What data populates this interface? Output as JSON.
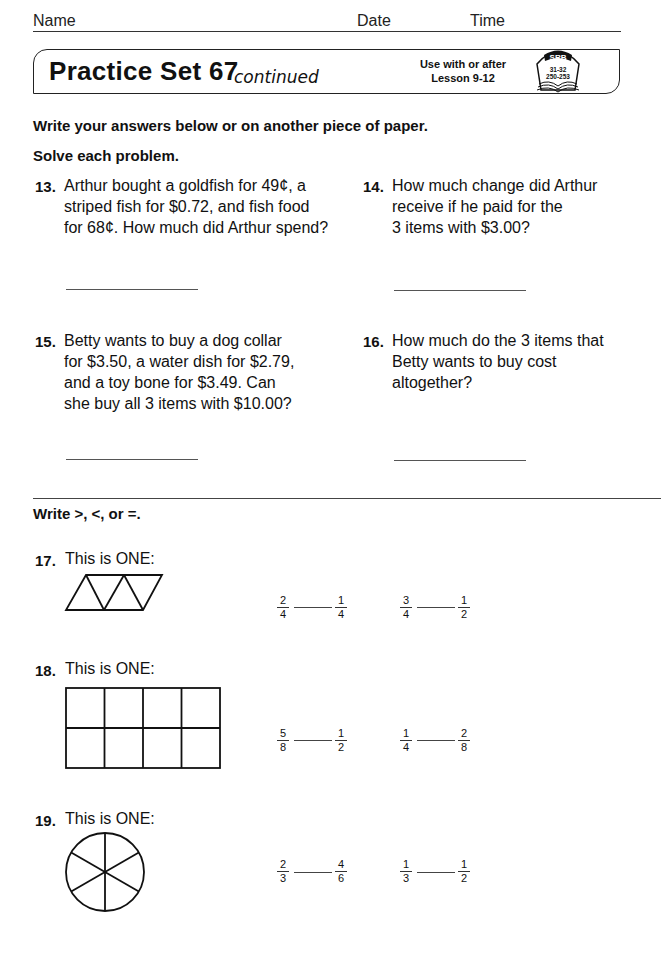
{
  "header": {
    "name_label": "Name",
    "date_label": "Date",
    "time_label": "Time"
  },
  "title": {
    "main": "Practice Set 67",
    "continued": "continued",
    "use_with_line1": "Use with or after",
    "use_with_line2": "Lesson 9-12",
    "srb_badge": "SRB",
    "srb_pages_line1": "31-32",
    "srb_pages_line2": "250-253"
  },
  "instructions": {
    "line1": "Write your answers below or on another piece of paper.",
    "line2": "Solve each problem."
  },
  "problems": [
    {
      "number": "13.",
      "lines": [
        "Arthur bought a goldfish for 49¢, a",
        "striped fish for $0.72, and fish food",
        "for 68¢. How much did Arthur spend?"
      ]
    },
    {
      "number": "14.",
      "lines": [
        "How much change did Arthur",
        "receive if he paid for the",
        "3 items with $3.00?"
      ]
    },
    {
      "number": "15.",
      "lines": [
        "Betty wants to buy a dog collar",
        "for $3.50, a water dish for $2.79,",
        "and a toy bone for $3.49. Can",
        "she buy all 3 items with $10.00?"
      ]
    },
    {
      "number": "16.",
      "lines": [
        "How much do the 3 items that",
        "Betty wants to buy cost",
        "altogether?"
      ]
    }
  ],
  "compare_section": {
    "instruction": "Write  >, <, or =.",
    "items": [
      {
        "number": "17.",
        "label": "This is ONE:",
        "shape": "parallelogram-of-4-triangles",
        "comparisons": [
          {
            "left": {
              "n": "2",
              "d": "4"
            },
            "right": {
              "n": "1",
              "d": "4"
            }
          },
          {
            "left": {
              "n": "3",
              "d": "4"
            },
            "right": {
              "n": "1",
              "d": "2"
            }
          }
        ]
      },
      {
        "number": "18.",
        "label": "This is ONE:",
        "shape": "rectangle-of-8-squares",
        "comparisons": [
          {
            "left": {
              "n": "5",
              "d": "8"
            },
            "right": {
              "n": "1",
              "d": "2"
            }
          },
          {
            "left": {
              "n": "1",
              "d": "4"
            },
            "right": {
              "n": "2",
              "d": "8"
            }
          }
        ]
      },
      {
        "number": "19.",
        "label": "This is ONE:",
        "shape": "circle-of-6-sectors",
        "comparisons": [
          {
            "left": {
              "n": "2",
              "d": "3"
            },
            "right": {
              "n": "4",
              "d": "6"
            }
          },
          {
            "left": {
              "n": "1",
              "d": "3"
            },
            "right": {
              "n": "1",
              "d": "2"
            }
          }
        ]
      }
    ]
  }
}
